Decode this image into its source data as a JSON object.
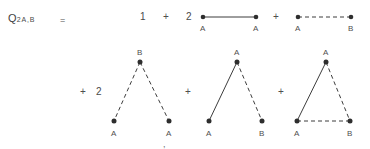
{
  "figure": {
    "formula_label": "Q",
    "formula_subscript": "2A,B",
    "equals": "=",
    "trailing_mark": ","
  },
  "row1": {
    "term1": {
      "coefficient": "1"
    },
    "op1": "+",
    "term2": {
      "coefficient": "2",
      "left_label": "A",
      "right_label": "A",
      "edge_style": "solid"
    },
    "op2": "+",
    "term3": {
      "coefficient": "",
      "left_label": "A",
      "right_label": "B",
      "edge_style": "dashed"
    }
  },
  "row2": {
    "op1": "+",
    "term4": {
      "coefficient": "2",
      "apex_label": "B",
      "left_label": "A",
      "right_label": "A",
      "left_edge_style": "dashed",
      "right_edge_style": "dashed",
      "base_edge_style": "none"
    },
    "op2": "+",
    "term5": {
      "coefficient": "",
      "apex_label": "A",
      "left_label": "A",
      "right_label": "B",
      "left_edge_style": "solid",
      "right_edge_style": "dashed",
      "base_edge_style": "none"
    },
    "op3": "+",
    "term6": {
      "coefficient": "",
      "apex_label": "A",
      "left_label": "A",
      "right_label": "B",
      "left_edge_style": "solid",
      "right_edge_style": "dashed",
      "base_edge_style": "dashed"
    }
  },
  "colors": {
    "ink": "#3d3d3d",
    "node": "#2e2e2e",
    "background": "#ffffff"
  }
}
